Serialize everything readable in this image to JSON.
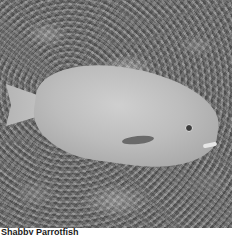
{
  "photo": {
    "subject": "Parrotfish resting on coral reef",
    "style": "grayscale",
    "colors": {
      "fish": "#c4c4c4",
      "reef": "#707070",
      "background": "#ffffff"
    }
  },
  "caption": {
    "text": "Shabby Parrotfish"
  }
}
